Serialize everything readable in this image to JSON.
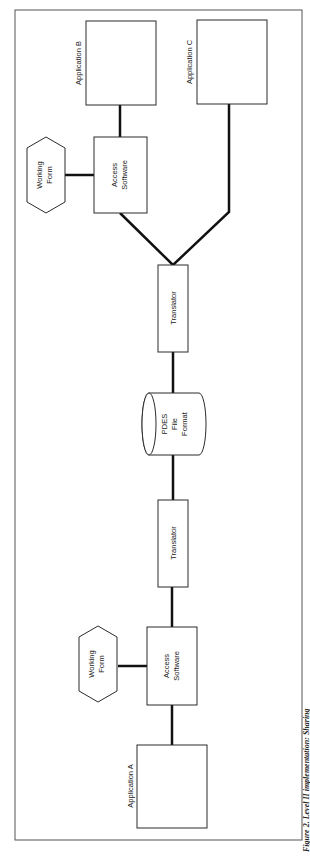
{
  "diagram": {
    "nodes": {
      "app_a": {
        "label": "Application A"
      },
      "app_b": {
        "label": "Application B"
      },
      "app_c": {
        "label": "Application C"
      },
      "access_a": {
        "line1": "Access",
        "line2": "Software"
      },
      "access_b": {
        "line1": "Access",
        "line2": "Software"
      },
      "working_a": {
        "line1": "Working",
        "line2": "Form"
      },
      "working_b": {
        "line1": "Working",
        "line2": "Form"
      },
      "translator_1": {
        "label": "Translator"
      },
      "translator_2": {
        "label": "Translator"
      },
      "pdes": {
        "line1": "PDES",
        "line2": "File",
        "line3": "Format"
      }
    },
    "edges": [
      [
        "app_a",
        "access_a"
      ],
      [
        "working_a",
        "access_a"
      ],
      [
        "access_a",
        "translator_1"
      ],
      [
        "translator_1",
        "pdes"
      ],
      [
        "pdes",
        "translator_2"
      ],
      [
        "translator_2",
        "access_b"
      ],
      [
        "translator_2",
        "app_c"
      ],
      [
        "working_b",
        "access_b"
      ],
      [
        "access_b",
        "app_b"
      ]
    ],
    "caption": "Figure 2. Level II implementation: Sharing"
  }
}
